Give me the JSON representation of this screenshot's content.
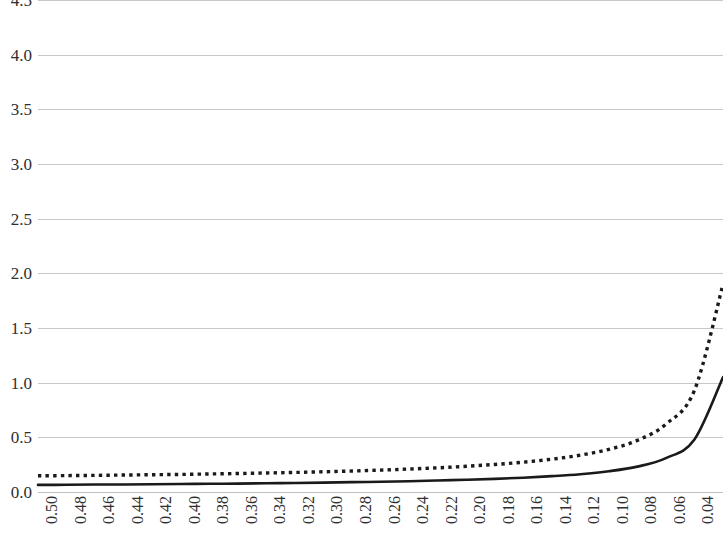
{
  "chart_data": {
    "type": "line",
    "title": "",
    "subtitle": "",
    "xlabel": "",
    "ylabel": "",
    "grid": true,
    "legend": "none",
    "xlim": [
      0.5,
      0.0
    ],
    "ylim": [
      0.0,
      4.5
    ],
    "x_axis_reversed": true,
    "y_ticks": [
      "4.5",
      "4.0",
      "3.5",
      "3.0",
      "2.5",
      "2.0",
      "1.5",
      "1.0",
      "0.5",
      "0.0"
    ],
    "y_tick_values": [
      4.5,
      4.0,
      3.5,
      3.0,
      2.5,
      2.0,
      1.5,
      1.0,
      0.5,
      0.0
    ],
    "categories": [
      "0.50",
      "0.48",
      "0.46",
      "0.44",
      "0.42",
      "0.40",
      "0.38",
      "0.36",
      "0.34",
      "0.32",
      "0.30",
      "0.28",
      "0.26",
      "0.24",
      "0.22",
      "0.20",
      "0.18",
      "0.16",
      "0.14",
      "0.12",
      "0.10",
      "0.08",
      "0.06",
      "0.04",
      "0.02"
    ],
    "x": [
      0.5,
      0.48,
      0.46,
      0.44,
      0.42,
      0.4,
      0.38,
      0.36,
      0.34,
      0.32,
      0.3,
      0.28,
      0.26,
      0.24,
      0.22,
      0.2,
      0.18,
      0.16,
      0.14,
      0.12,
      0.1,
      0.08,
      0.06,
      0.04,
      0.02
    ],
    "series": [
      {
        "name": "solid-series",
        "style": "solid",
        "color": "#1a1a1a",
        "values": [
          0.065,
          0.066,
          0.068,
          0.069,
          0.071,
          0.073,
          0.075,
          0.077,
          0.08,
          0.083,
          0.086,
          0.09,
          0.094,
          0.099,
          0.105,
          0.112,
          0.12,
          0.131,
          0.145,
          0.163,
          0.19,
          0.232,
          0.31,
          0.48,
          1.05
        ]
      },
      {
        "name": "dashed-series",
        "style": "dashed",
        "color": "#1a1a1a",
        "values": [
          0.148,
          0.15,
          0.152,
          0.155,
          0.158,
          0.161,
          0.165,
          0.169,
          0.174,
          0.179,
          0.185,
          0.192,
          0.2,
          0.21,
          0.221,
          0.235,
          0.252,
          0.273,
          0.3,
          0.337,
          0.39,
          0.472,
          0.62,
          0.93,
          1.9
        ]
      }
    ]
  }
}
